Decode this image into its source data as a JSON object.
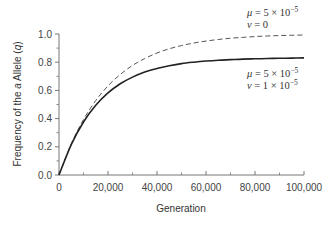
{
  "chart_data": {
    "type": "line",
    "title": "",
    "xlabel": "Generation",
    "ylabel_parts": [
      "Frequency of the ",
      "a",
      " Allele (",
      "q",
      ")"
    ],
    "ylabel": "Frequency of the a Allele (q)",
    "xlim": [
      0,
      100000
    ],
    "ylim": [
      0,
      1.0
    ],
    "x_ticks": [
      0,
      20000,
      40000,
      60000,
      80000,
      100000
    ],
    "x_tick_labels": [
      "0",
      "20,000",
      "40,000",
      "60,000",
      "80,000",
      "100,000"
    ],
    "x_minor_ticks": [
      10000,
      30000,
      50000,
      70000,
      90000
    ],
    "y_ticks": [
      0,
      0.2,
      0.4,
      0.6,
      0.8,
      1.0
    ],
    "y_tick_labels": [
      "0.0",
      "0.2",
      "0.4",
      "0.6",
      "0.8",
      "1.0"
    ],
    "y_minor_ticks": [
      0.1,
      0.3,
      0.5,
      0.7,
      0.9
    ],
    "grid": false,
    "x": [
      0,
      5000,
      10000,
      15000,
      20000,
      25000,
      30000,
      35000,
      40000,
      45000,
      50000,
      55000,
      60000,
      65000,
      70000,
      75000,
      80000,
      85000,
      90000,
      95000,
      100000
    ],
    "series": [
      {
        "name": "mu = 5 x 10^-5, nu = 0",
        "style": "dashed",
        "color": "#555555",
        "values": [
          0.0,
          0.221,
          0.393,
          0.528,
          0.632,
          0.713,
          0.777,
          0.826,
          0.865,
          0.895,
          0.918,
          0.936,
          0.95,
          0.961,
          0.97,
          0.976,
          0.982,
          0.986,
          0.989,
          0.991,
          0.993
        ]
      },
      {
        "name": "mu = 5 x 10^-5, nu = 1 x 10^-5",
        "style": "solid",
        "color": "#222222",
        "values": [
          0.0,
          0.216,
          0.376,
          0.494,
          0.582,
          0.647,
          0.694,
          0.73,
          0.756,
          0.775,
          0.79,
          0.8,
          0.808,
          0.814,
          0.818,
          0.822,
          0.824,
          0.826,
          0.828,
          0.829,
          0.831
        ]
      }
    ],
    "annotations": [
      {
        "line1": {
          "sym": "μ",
          "text": " = 5 × 10",
          "exp": "−5"
        },
        "line2": {
          "sym": "ν",
          "text": " = 0",
          "exp": ""
        },
        "refers_to": "dashed"
      },
      {
        "line1": {
          "sym": "μ",
          "text": " = 5 × 10",
          "exp": "−5"
        },
        "line2": {
          "sym": "ν",
          "text": " = 1 × 10",
          "exp": "−5"
        },
        "refers_to": "solid"
      }
    ]
  },
  "labels": {
    "xlabel": "Generation",
    "ylabel_a": "Frequency of the ",
    "ylabel_b": "a",
    "ylabel_c": " Allele (",
    "ylabel_d": "q",
    "ylabel_e": ")",
    "ann1_mu": "μ",
    "ann1_mu_rest": " = 5 × 10",
    "ann1_mu_exp": "−5",
    "ann1_nu": "ν",
    "ann1_nu_rest": " = 0",
    "ann2_mu": "μ",
    "ann2_mu_rest": " = 5 × 10",
    "ann2_mu_exp": "−5",
    "ann2_nu": "ν",
    "ann2_nu_rest": " = 1 × 10",
    "ann2_nu_exp": "−5"
  }
}
